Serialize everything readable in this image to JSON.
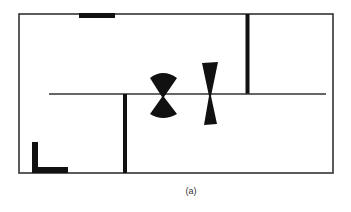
{
  "figure": {
    "caption": "(a)"
  },
  "colors": {
    "background": "#ffffff",
    "line": "#333333",
    "fill": "#111111"
  },
  "elements": {
    "outer_boundary": {
      "x": 19,
      "y": 14,
      "width": 314,
      "height": 159
    },
    "top_bar": {
      "x": 79,
      "y": 13,
      "width": 36,
      "height": 5
    },
    "wall_upper_right": {
      "x": 247,
      "y1": 14,
      "y2": 94,
      "thickness": 4
    },
    "wall_lower_middle": {
      "x": 125,
      "y1": 94,
      "y2": 173,
      "thickness": 4
    },
    "center_line": {
      "x1": 49,
      "x2": 326,
      "y": 94
    },
    "l_marker": {
      "x": 32,
      "y": 142,
      "vertical_height": 31,
      "horizontal_width": 36,
      "thickness": 6
    },
    "bowtie_wide": {
      "cx": 163,
      "cy": 97,
      "half_width": 13,
      "top_y": 72,
      "bottom_y": 117
    },
    "bowtie_narrow": {
      "cx": 210,
      "cy": 94,
      "half_width": 8,
      "top_y": 62,
      "bottom_y": 125
    }
  }
}
